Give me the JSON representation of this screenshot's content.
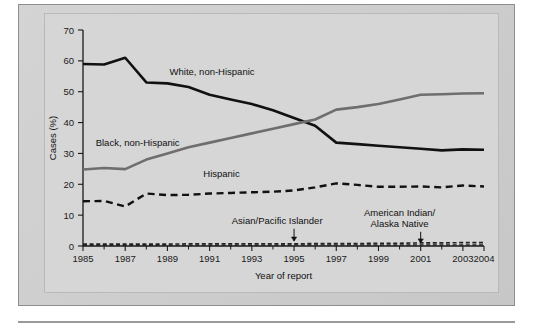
{
  "figure": {
    "background_color": "#cfcfcf",
    "plot_background_color": "#d6d6d6"
  },
  "chart_data": {
    "type": "line",
    "title": "",
    "subtitle": "",
    "xlabel": "Year of report",
    "ylabel": "Cases (%)",
    "xlim": [
      1985,
      2004
    ],
    "ylim": [
      0,
      70
    ],
    "y_ticks": [
      0,
      10,
      20,
      30,
      40,
      50,
      60,
      70
    ],
    "y_tick_labels": [
      "0",
      "10",
      "20",
      "30",
      "40",
      "50",
      "60",
      "70"
    ],
    "x_ticks": [
      1985,
      1986,
      1987,
      1988,
      1989,
      1990,
      1991,
      1992,
      1993,
      1994,
      1995,
      1996,
      1997,
      1998,
      1999,
      2000,
      2001,
      2002,
      2003,
      2004
    ],
    "x_tick_labels": [
      "1985",
      "",
      "1987",
      "",
      "1989",
      "",
      "1991",
      "",
      "1993",
      "",
      "1995",
      "",
      "1997",
      "",
      "1999",
      "",
      "2001",
      "",
      "2003",
      "2004"
    ],
    "grid": false,
    "legend_position": "inline-annotations",
    "x": [
      1985,
      1986,
      1987,
      1988,
      1989,
      1990,
      1991,
      1992,
      1993,
      1994,
      1995,
      1996,
      1997,
      1998,
      1999,
      2000,
      2001,
      2002,
      2003,
      2004
    ],
    "series": [
      {
        "name": "White, non-Hispanic",
        "color": "#111111",
        "style": "solid",
        "width": 2.6,
        "label_x": 1989.1,
        "label_y": 55.5,
        "values": [
          59.0,
          58.8,
          61.0,
          53.0,
          52.7,
          51.5,
          49.0,
          47.5,
          46.0,
          44.0,
          41.5,
          39.0,
          33.5,
          33.0,
          32.5,
          32.0,
          31.5,
          31.0,
          31.3,
          31.2
        ]
      },
      {
        "name": "Black, non-Hispanic",
        "color": "#6e6e6e",
        "style": "solid",
        "width": 2.6,
        "label_x": 1985.6,
        "label_y": 32.5,
        "values": [
          24.8,
          25.3,
          24.9,
          28.0,
          30.0,
          32.0,
          33.5,
          35.0,
          36.5,
          38.0,
          39.5,
          41.0,
          44.2,
          45.0,
          46.0,
          47.5,
          49.0,
          49.2,
          49.4,
          49.5
        ]
      },
      {
        "name": "Hispanic",
        "color": "#111111",
        "style": "dashed",
        "width": 2.4,
        "label_x": 1990.7,
        "label_y": 22.5,
        "values": [
          14.5,
          14.6,
          12.8,
          17.0,
          16.5,
          16.6,
          17.0,
          17.2,
          17.4,
          17.6,
          18.0,
          19.0,
          20.3,
          19.8,
          19.2,
          19.2,
          19.3,
          19.0,
          19.6,
          19.3
        ]
      },
      {
        "name": "Asian/Pacific Islander",
        "color": "#222222",
        "style": "dashed",
        "width": 1.6,
        "values": [
          0.6,
          0.6,
          0.6,
          0.6,
          0.6,
          0.7,
          0.7,
          0.7,
          0.7,
          0.7,
          0.7,
          0.8,
          0.8,
          0.8,
          0.9,
          0.9,
          1.0,
          1.0,
          1.1,
          1.1
        ]
      },
      {
        "name": "American Indian/Alaska Native",
        "color": "#222222",
        "style": "dashed",
        "width": 1.4,
        "values": [
          0.2,
          0.2,
          0.2,
          0.2,
          0.2,
          0.2,
          0.2,
          0.2,
          0.2,
          0.2,
          0.3,
          0.3,
          0.3,
          0.3,
          0.3,
          0.3,
          0.3,
          0.3,
          0.3,
          0.3
        ]
      }
    ],
    "annotations": [
      {
        "id": "asian-pacific-islander",
        "text_lines": [
          "Asian/Pacific Islander"
        ],
        "text_x": 1994.2,
        "text_y": 7.2,
        "arrow_x": 1995.0,
        "arrow_from_y": 5.6,
        "arrow_to_y": 1.6
      },
      {
        "id": "american-indian-alaska-native",
        "text_lines": [
          "American Indian/",
          "Alaska Native"
        ],
        "text_x": 2000.0,
        "text_y": 9.6,
        "arrow_x": 2001.0,
        "arrow_from_y": 4.6,
        "arrow_to_y": 1.0
      }
    ]
  }
}
